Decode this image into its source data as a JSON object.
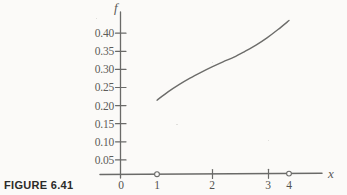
{
  "figure": {
    "caption": "FIGURE 6.41",
    "background_color": "#fbfaf8",
    "ink_color": "#6a6a68"
  },
  "chart_data": {
    "type": "line",
    "title": "",
    "subtitle": "",
    "xlabel": "x",
    "ylabel": "f",
    "xlim": [
      0,
      4.6
    ],
    "ylim": [
      0,
      0.45
    ],
    "grid": false,
    "legend": "none",
    "x_ticks": [
      0,
      1,
      2,
      3,
      4
    ],
    "x_tick_labels": [
      "0",
      "1",
      "2",
      "3",
      "4"
    ],
    "x_marker_ticks": [
      1,
      4
    ],
    "y_ticks": [
      0.05,
      0.1,
      0.15,
      0.2,
      0.25,
      0.3,
      0.35,
      0.4
    ],
    "y_tick_labels": [
      "0.05",
      "0.10",
      "0.15",
      "0.20",
      "0.25",
      "0.30",
      "0.35",
      "0.40"
    ],
    "series": [
      {
        "name": "f",
        "x": [
          1.0,
          1.25,
          1.5,
          1.75,
          2.0,
          2.25,
          2.5,
          2.75,
          3.0,
          3.25,
          3.5,
          3.75,
          4.0
        ],
        "values": [
          0.215,
          0.238,
          0.258,
          0.276,
          0.292,
          0.307,
          0.321,
          0.334,
          0.35,
          0.367,
          0.387,
          0.41,
          0.435
        ]
      }
    ],
    "annotations": []
  },
  "axis_labels": {
    "y": "f",
    "x": "x"
  }
}
